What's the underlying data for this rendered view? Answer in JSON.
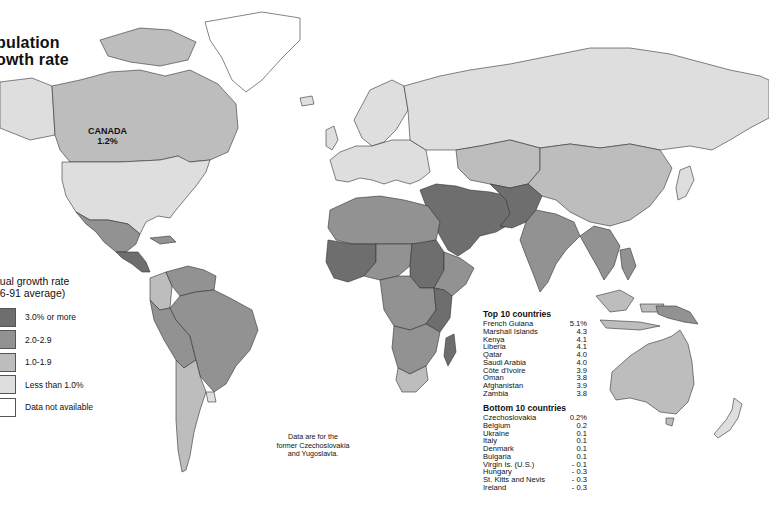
{
  "title": {
    "line1": "pulation",
    "line2": "owth rate"
  },
  "callout": {
    "country": "CANADA",
    "value": "1.2%"
  },
  "legend": {
    "title_line1": "nual growth rate",
    "title_line2": "86-91 average)",
    "items": [
      {
        "label": "3.0% or more",
        "color": "#6e6e6e"
      },
      {
        "label": "2.0-2.9",
        "color": "#929292"
      },
      {
        "label": "1.0-1.9",
        "color": "#bdbdbd"
      },
      {
        "label": "Less than 1.0%",
        "color": "#dedede"
      },
      {
        "label": "Data not available",
        "color": "#ffffff"
      }
    ]
  },
  "note": {
    "line1": "Data are for the",
    "line2": "former Czechoslovakia",
    "line3": "and Yugoslavia."
  },
  "top10": {
    "heading": "Top 10 countries",
    "rows": [
      {
        "country": "French Guiana",
        "value": "5.1%"
      },
      {
        "country": "Marshall Islands",
        "value": "4.3"
      },
      {
        "country": "Kenya",
        "value": "4.1"
      },
      {
        "country": "Liberia",
        "value": "4.1"
      },
      {
        "country": "Qatar",
        "value": "4.0"
      },
      {
        "country": "Saudi Arabia",
        "value": "4.0"
      },
      {
        "country": "Côte d'Ivoire",
        "value": "3.9"
      },
      {
        "country": "Oman",
        "value": "3.8"
      },
      {
        "country": "Afghanistan",
        "value": "3.9"
      },
      {
        "country": "Zambia",
        "value": "3.8"
      }
    ]
  },
  "bottom10": {
    "heading": "Bottom 10 countries",
    "rows": [
      {
        "country": "Czechoslovakia",
        "value": "0.2%"
      },
      {
        "country": "Belgium",
        "value": "0.2"
      },
      {
        "country": "Ukraine",
        "value": "0.1"
      },
      {
        "country": "Italy",
        "value": "0.1"
      },
      {
        "country": "Denmark",
        "value": "0.1"
      },
      {
        "country": "Bulgaria",
        "value": "0.1"
      },
      {
        "country": "Virgin Is. (U.S.)",
        "value": "- 0.1"
      },
      {
        "country": "Hungary",
        "value": "- 0.3"
      },
      {
        "country": "St. Kitts and Nevis",
        "value": "- 0.3"
      },
      {
        "country": "Ireland",
        "value": "- 0.3"
      }
    ]
  },
  "regions": [
    {
      "name": "canada",
      "class": "1.0-1.9"
    },
    {
      "name": "greenland",
      "class": "Data not available"
    },
    {
      "name": "usa",
      "class": "Less than 1.0%"
    },
    {
      "name": "mexico",
      "class": "2.0-2.9"
    },
    {
      "name": "central-america",
      "class": "3.0% or more"
    },
    {
      "name": "south-america-north",
      "class": "2.0-2.9"
    },
    {
      "name": "colombia",
      "class": "1.0-1.9"
    },
    {
      "name": "brazil",
      "class": "2.0-2.9"
    },
    {
      "name": "argentina-chile",
      "class": "1.0-1.9"
    },
    {
      "name": "uruguay",
      "class": "Less than 1.0%"
    },
    {
      "name": "europe",
      "class": "Less than 1.0%"
    },
    {
      "name": "russia",
      "class": "Less than 1.0%"
    },
    {
      "name": "central-asia",
      "class": "1.0-1.9"
    },
    {
      "name": "china",
      "class": "1.0-1.9"
    },
    {
      "name": "middle-east",
      "class": "3.0% or more"
    },
    {
      "name": "north-africa",
      "class": "2.0-2.9"
    },
    {
      "name": "west-africa",
      "class": "3.0% or more"
    },
    {
      "name": "sahel",
      "class": "2.0-2.9"
    },
    {
      "name": "sudan",
      "class": "3.0% or more"
    },
    {
      "name": "central-africa",
      "class": "2.0-2.9"
    },
    {
      "name": "east-africa",
      "class": "3.0% or more"
    },
    {
      "name": "southern-africa",
      "class": "2.0-2.9"
    },
    {
      "name": "south-africa",
      "class": "1.0-1.9"
    },
    {
      "name": "madagascar",
      "class": "3.0% or more"
    },
    {
      "name": "india",
      "class": "2.0-2.9"
    },
    {
      "name": "southeast-asia",
      "class": "2.0-2.9"
    },
    {
      "name": "indonesia",
      "class": "1.0-1.9"
    },
    {
      "name": "australia",
      "class": "1.0-1.9"
    },
    {
      "name": "new-zealand",
      "class": "Less than 1.0%"
    },
    {
      "name": "japan",
      "class": "Less than 1.0%"
    }
  ]
}
